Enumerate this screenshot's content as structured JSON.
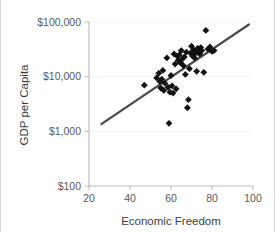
{
  "chart_data": {
    "type": "scatter",
    "title": "",
    "xlabel": "Economic Freedom",
    "ylabel": "GDP per Capita",
    "xlim": [
      20,
      100
    ],
    "ylim": [
      100,
      100000
    ],
    "yscale": "log",
    "xscale": "linear",
    "grid": true,
    "legend": null,
    "xticks": [
      20,
      40,
      60,
      80,
      100
    ],
    "xtick_labels": [
      "20",
      "40",
      "60",
      "80",
      "100"
    ],
    "yticks": [
      100,
      1000,
      10000,
      100000
    ],
    "ytick_labels": [
      "$100",
      "$1,000",
      "$10,000",
      "$100,000"
    ],
    "marker": "diamond",
    "marker_color": "#111111",
    "trendline": {
      "color": "#4a4a4a",
      "x_start": 26,
      "y_start": 1350,
      "x_end": 98,
      "y_end": 90000
    },
    "points": [
      {
        "x": 47,
        "y": 7000
      },
      {
        "x": 53,
        "y": 9500
      },
      {
        "x": 54,
        "y": 11500
      },
      {
        "x": 54.5,
        "y": 8200
      },
      {
        "x": 55,
        "y": 6200
      },
      {
        "x": 55.5,
        "y": 9000
      },
      {
        "x": 56,
        "y": 13000
      },
      {
        "x": 56.5,
        "y": 5600
      },
      {
        "x": 57,
        "y": 7600
      },
      {
        "x": 58,
        "y": 22000
      },
      {
        "x": 58.5,
        "y": 6400
      },
      {
        "x": 59,
        "y": 1400
      },
      {
        "x": 59.5,
        "y": 5200
      },
      {
        "x": 60,
        "y": 10500
      },
      {
        "x": 60.5,
        "y": 6800
      },
      {
        "x": 61,
        "y": 5000
      },
      {
        "x": 61.5,
        "y": 26000
      },
      {
        "x": 62,
        "y": 17000
      },
      {
        "x": 62.5,
        "y": 6000
      },
      {
        "x": 63,
        "y": 24000
      },
      {
        "x": 63.5,
        "y": 20000
      },
      {
        "x": 64,
        "y": 25000
      },
      {
        "x": 64.5,
        "y": 18000
      },
      {
        "x": 65,
        "y": 30000
      },
      {
        "x": 65.5,
        "y": 21000
      },
      {
        "x": 66,
        "y": 16000
      },
      {
        "x": 66.5,
        "y": 23000
      },
      {
        "x": 67,
        "y": 11000
      },
      {
        "x": 67.5,
        "y": 28000
      },
      {
        "x": 68,
        "y": 2700
      },
      {
        "x": 68.5,
        "y": 3800
      },
      {
        "x": 69,
        "y": 14000
      },
      {
        "x": 69.5,
        "y": 27000
      },
      {
        "x": 70,
        "y": 36000
      },
      {
        "x": 70.5,
        "y": 24000
      },
      {
        "x": 71,
        "y": 31000
      },
      {
        "x": 71.5,
        "y": 22000
      },
      {
        "x": 72,
        "y": 27000
      },
      {
        "x": 72.5,
        "y": 12500
      },
      {
        "x": 73,
        "y": 33000
      },
      {
        "x": 73.5,
        "y": 29000
      },
      {
        "x": 74,
        "y": 26000
      },
      {
        "x": 74.5,
        "y": 34000
      },
      {
        "x": 75,
        "y": 30000
      },
      {
        "x": 76,
        "y": 12000
      },
      {
        "x": 77,
        "y": 70000
      },
      {
        "x": 78,
        "y": 32000
      },
      {
        "x": 79,
        "y": 35000
      },
      {
        "x": 80,
        "y": 29000
      },
      {
        "x": 81,
        "y": 30000
      }
    ]
  }
}
